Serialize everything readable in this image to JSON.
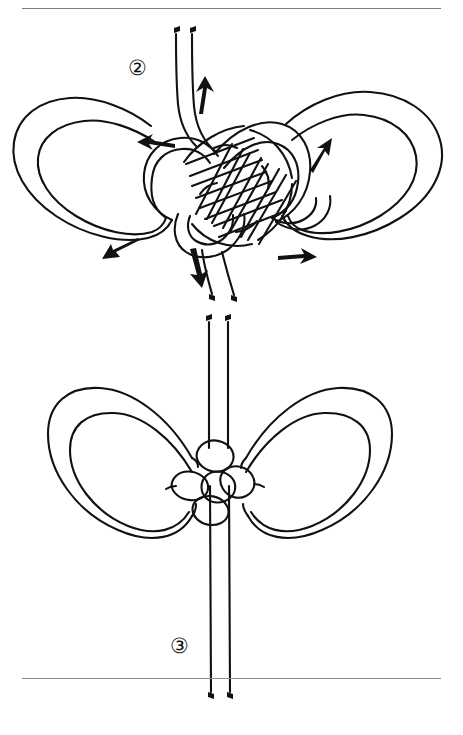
{
  "page": {
    "width": 463,
    "height": 735,
    "background_color": "#ffffff",
    "ink_color": "#111111",
    "rule_color": "#7a7a7a",
    "header_text": "",
    "document_type": "knot-tying instruction page"
  },
  "rules": {
    "top_label": "top horizontal rule",
    "bottom_label": "bottom horizontal rule"
  },
  "figures": [
    {
      "id": "fig2",
      "step_number": "②",
      "step_number_plain": "2",
      "caption": "",
      "description": "Loose butterfly knot with two large side loops and an interlaced woven center; two working cord ends rise from the center top and two descend from the center bottom; directional arrows indicate the tightening pull directions.",
      "loops": 2,
      "cord_ends_top": 2,
      "cord_ends_bottom": 2,
      "arrows": [
        {
          "name": "arrow-up-top-center",
          "direction": "up",
          "x": 203,
          "y": 72
        },
        {
          "name": "arrow-left-upper",
          "direction": "left",
          "x": 152,
          "y": 120
        },
        {
          "name": "arrow-right-loop",
          "direction": "up-right",
          "x": 321,
          "y": 130
        },
        {
          "name": "arrow-left-lower",
          "direction": "down-left",
          "x": 124,
          "y": 232
        },
        {
          "name": "arrow-down-bottom-center",
          "direction": "down",
          "x": 211,
          "y": 250
        },
        {
          "name": "arrow-right-lower",
          "direction": "right",
          "x": 296,
          "y": 239
        }
      ]
    },
    {
      "id": "fig3",
      "step_number": "③",
      "step_number_plain": "3",
      "caption": "",
      "description": "The finished tightened bow knot: two symmetric teardrop loops flank a compact woven center, with a pair of straight parallel cords running vertically through the knot and extending well past the bottom rule.",
      "loops": 2,
      "cord_ends_top": 2,
      "cord_ends_bottom": 2,
      "arrows": []
    }
  ]
}
